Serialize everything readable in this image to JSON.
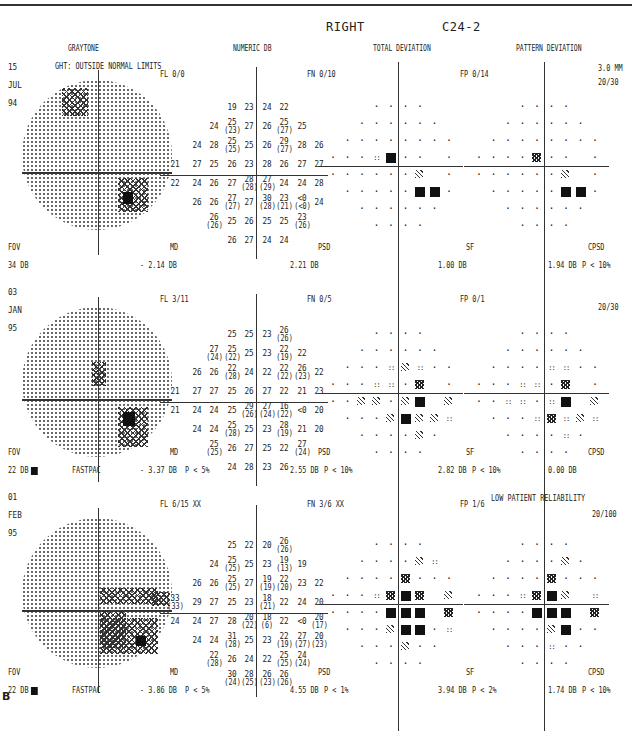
{
  "header": {
    "eye": "RIGHT",
    "test": "C24-2",
    "columns": [
      "GRAYTONE",
      "NUMERIC DB",
      "TOTAL DEVIATION",
      "PATTERN DEVIATION"
    ]
  },
  "figure_label": "B",
  "panels": [
    {
      "date": [
        "15",
        "JUL",
        "94"
      ],
      "ght": "GHT: OUTSIDE NORMAL LIMITS",
      "fl": "FL  0/0",
      "fn": "FN  0/10",
      "fp": "FP  0/14",
      "pupil": "3.0 MM",
      "acuity": "20/30",
      "reliability_note": "",
      "fov_label": "FOV",
      "fov_value": "34 DB",
      "fov_marker": false,
      "strategy": "",
      "md_label": "MD",
      "md_value": "- 2.14 DB",
      "md_p": "",
      "psd_label": "PSD",
      "psd_value": "2.21 DB",
      "psd_p": "",
      "sf_label": "SF",
      "sf_value": "1.00 DB",
      "sf_p": "",
      "cpsd_label": "CPSD",
      "cpsd_value": "1.94 DB",
      "cpsd_p": "P <  10%",
      "numeric_rows": [
        [
          "",
          "",
          "",
          "19",
          "23",
          "24",
          "22",
          "",
          ""
        ],
        [
          "",
          "",
          "24",
          "25 (23)",
          "27",
          "26",
          "25 (27)",
          "25",
          ""
        ],
        [
          "",
          "24",
          "28",
          "25 (25)",
          "25",
          "26",
          "29 (27)",
          "28",
          "26"
        ],
        [
          "21",
          "27",
          "25",
          "26",
          "23",
          "28",
          "26",
          "27",
          "27"
        ],
        [
          "22",
          "24",
          "26",
          "27",
          "28 (28)",
          "27 (29)",
          "24",
          "24",
          "28"
        ],
        [
          "",
          "26",
          "26",
          "27 (27)",
          "27",
          "30 (28)",
          "23 (21)",
          "<0 (<0)",
          "24"
        ],
        [
          "",
          "",
          "26 (26)",
          "25",
          "26",
          "25",
          "25",
          "23 (26)",
          ""
        ],
        [
          "",
          "",
          "",
          "26",
          "27",
          "24",
          "24",
          "",
          ""
        ]
      ],
      "total_dev_rows": [
        [
          "",
          "",
          "",
          ".",
          ".",
          ".",
          ".",
          "",
          ""
        ],
        [
          "",
          "",
          ".",
          ".",
          ".",
          ".",
          ".",
          ".",
          ""
        ],
        [
          "",
          ".",
          ".",
          ".",
          ".",
          ".",
          ".",
          ".",
          "."
        ],
        [
          ".",
          ".",
          ".",
          "2",
          "05",
          ".",
          ".",
          "",
          "."
        ],
        [
          ".",
          ".",
          ".",
          ".",
          ".",
          ".",
          "5",
          "",
          "."
        ],
        [
          "",
          ".",
          ".",
          ".",
          ".",
          ".",
          "05",
          "05",
          "."
        ],
        [
          "",
          "",
          ".",
          ".",
          ".",
          ".",
          ".",
          ".",
          ""
        ],
        [
          "",
          "",
          "",
          ".",
          ".",
          ".",
          ".",
          "",
          ""
        ]
      ],
      "pattern_dev_rows": [
        [
          "",
          "",
          "",
          ".",
          ".",
          ".",
          ".",
          "",
          ""
        ],
        [
          "",
          "",
          ".",
          ".",
          ".",
          ".",
          ".",
          ".",
          ""
        ],
        [
          "",
          ".",
          ".",
          ".",
          ".",
          ".",
          ".",
          ".",
          "."
        ],
        [
          ".",
          ".",
          ".",
          ".",
          "1",
          ".",
          ".",
          "",
          "."
        ],
        [
          ".",
          ".",
          ".",
          ".",
          ".",
          ".",
          "5",
          "",
          "."
        ],
        [
          "",
          ".",
          ".",
          ".",
          ".",
          ".",
          "05",
          "05",
          "."
        ],
        [
          "",
          "",
          ".",
          ".",
          ".",
          ".",
          ".",
          ".",
          ""
        ],
        [
          "",
          "",
          "",
          ".",
          ".",
          ".",
          ".",
          "",
          ""
        ]
      ]
    },
    {
      "date": [
        "03",
        "JAN",
        "95"
      ],
      "ght": "",
      "fl": "FL  3/11",
      "fn": "FN  0/5",
      "fp": "FP  0/1",
      "pupil": "",
      "acuity": "20/30",
      "reliability_note": "",
      "fov_label": "FOV",
      "fov_value": "22 DB",
      "fov_marker": true,
      "strategy": "FASTPAC",
      "md_label": "MD",
      "md_value": "- 3.37 DB",
      "md_p": "P <  5%",
      "psd_label": "PSD",
      "psd_value": "2.55 DB",
      "psd_p": "P <  10%",
      "sf_label": "SF",
      "sf_value": "2.82 DB",
      "sf_p": "P <  10%",
      "cpsd_label": "CPSD",
      "cpsd_value": "0.00 DB",
      "cpsd_p": "",
      "numeric_rows": [
        [
          "",
          "",
          "",
          "25",
          "25",
          "23",
          "26 (26)",
          "",
          ""
        ],
        [
          "",
          "",
          "27 (24)",
          "25 (22)",
          "25",
          "23",
          "22 (19)",
          "22",
          ""
        ],
        [
          "",
          "26",
          "26",
          "22 (28)",
          "24",
          "22",
          "22 (22)",
          "26 (23)",
          "22"
        ],
        [
          "21",
          "27",
          "27",
          "25",
          "26",
          "27",
          "22",
          "21",
          "23"
        ],
        [
          "21",
          "24",
          "24",
          "25",
          "29 (26)",
          "27 (24)",
          "16 (22)",
          "<0",
          "20"
        ],
        [
          "",
          "24",
          "24",
          "25 (28)",
          "25",
          "23",
          "28 (19)",
          "21",
          "20"
        ],
        [
          "",
          "",
          "25 (25)",
          "26",
          "27",
          "25",
          "22",
          "27 (24)",
          ""
        ],
        [
          "",
          "",
          "",
          "24",
          "28",
          "23",
          "26",
          "",
          ""
        ]
      ],
      "total_dev_rows": [
        [
          "",
          "",
          "",
          ".",
          ".",
          ".",
          ".",
          "",
          ""
        ],
        [
          "",
          "",
          ".",
          ".",
          ".",
          ".",
          ".",
          ".",
          ""
        ],
        [
          "",
          ".",
          ".",
          ".",
          "2",
          "5",
          "2",
          ".",
          "."
        ],
        [
          ".",
          ".",
          ".",
          "2",
          "2",
          ".",
          "1",
          "",
          "."
        ],
        [
          ".",
          ".",
          "5",
          "5",
          ".",
          "5",
          "05",
          "",
          "5"
        ],
        [
          "",
          ".",
          ".",
          ".",
          "5",
          "05",
          "5",
          "5",
          "2"
        ],
        [
          "",
          "",
          ".",
          ".",
          ".",
          ".",
          "5",
          ".",
          ""
        ],
        [
          "",
          "",
          "",
          ".",
          ".",
          ".",
          ".",
          "",
          ""
        ]
      ],
      "pattern_dev_rows": [
        [
          "",
          "",
          "",
          ".",
          ".",
          ".",
          ".",
          "",
          ""
        ],
        [
          "",
          "",
          ".",
          ".",
          ".",
          ".",
          ".",
          ".",
          ""
        ],
        [
          "",
          ".",
          ".",
          ".",
          ".",
          "2",
          "2",
          ".",
          "."
        ],
        [
          ".",
          ".",
          ".",
          "2",
          "2",
          ".",
          "1",
          "",
          "."
        ],
        [
          ".",
          ".",
          "2",
          "2",
          ".",
          "2",
          "05",
          "",
          "5"
        ],
        [
          "",
          ".",
          ".",
          ".",
          "2",
          "1",
          "2",
          "5",
          "2"
        ],
        [
          "",
          "",
          ".",
          ".",
          ".",
          ".",
          "2",
          ".",
          ""
        ],
        [
          "",
          "",
          "",
          ".",
          ".",
          ".",
          ".",
          "",
          ""
        ]
      ]
    },
    {
      "date": [
        "01",
        "FEB",
        "95"
      ],
      "ght": "",
      "fl": "FL  6/15 XX",
      "fn": "FN  3/6 XX",
      "fp": "FP  1/6",
      "pupil": "",
      "acuity": "20/100",
      "reliability_note": "LOW PATIENT RELIABILITY",
      "fov_label": "FOV",
      "fov_value": "22 DB",
      "fov_marker": true,
      "strategy": "FASTPAC",
      "md_label": "MD",
      "md_value": "- 3.86 DB",
      "md_p": "P <  5%",
      "psd_label": "PSD",
      "psd_value": "4.55 DB",
      "psd_p": "P <  1%",
      "sf_label": "SF",
      "sf_value": "3.94 DB",
      "sf_p": "P <  2%",
      "cpsd_label": "CPSD",
      "cpsd_value": "1.74 DB",
      "cpsd_p": "P <  10%",
      "numeric_rows": [
        [
          "",
          "",
          "",
          "25",
          "22",
          "20",
          "26 (26)",
          "",
          ""
        ],
        [
          "",
          "",
          "24",
          "25 (25)",
          "25",
          "23",
          "19 (13)",
          "19",
          ""
        ],
        [
          "",
          "26",
          "26",
          "25 (25)",
          "27",
          "19 (19)",
          "22 (20)",
          "23",
          "22"
        ],
        [
          "33 (33)",
          "29",
          "27",
          "25",
          "23",
          "18 (21)",
          "22",
          "24",
          "20"
        ],
        [
          "24",
          "24",
          "27",
          "28",
          "20 (22)",
          "18 (6)",
          "22",
          "<0",
          "20 (17)"
        ],
        [
          "",
          "24",
          "24",
          "31 (28)",
          "25",
          "23",
          "22 (19)",
          "27 (27)",
          "20 (23)"
        ],
        [
          "",
          "",
          "22 (28)",
          "26",
          "24",
          "22",
          "25 (25)",
          "24 (24)",
          ""
        ],
        [
          "",
          "",
          "",
          "30 (24)",
          "28 (25)",
          "26 (23)",
          "26 (26)",
          "",
          ""
        ]
      ],
      "total_dev_rows": [
        [
          "",
          "",
          "",
          ".",
          ".",
          ".",
          ".",
          "",
          ""
        ],
        [
          "",
          "",
          ".",
          ".",
          ".",
          ".",
          "5",
          "2",
          ""
        ],
        [
          "",
          ".",
          ".",
          ".",
          ".",
          "1",
          ".",
          ".",
          "."
        ],
        [
          ".",
          ".",
          ".",
          "2",
          "1",
          "05",
          "1",
          "",
          "5"
        ],
        [
          ".",
          ".",
          ".",
          ".",
          "05",
          "05",
          "05",
          "",
          "1"
        ],
        [
          "",
          ".",
          ".",
          ".",
          "5",
          "05",
          "05",
          ".",
          "2"
        ],
        [
          "",
          "",
          ".",
          ".",
          ".",
          "5",
          ".",
          ".",
          ""
        ],
        [
          "",
          "",
          "",
          ".",
          ".",
          ".",
          ".",
          "",
          ""
        ]
      ],
      "pattern_dev_rows": [
        [
          "",
          "",
          "",
          ".",
          ".",
          ".",
          ".",
          "",
          ""
        ],
        [
          "",
          "",
          ".",
          ".",
          ".",
          ".",
          "5",
          ".",
          ""
        ],
        [
          "",
          ".",
          ".",
          ".",
          ".",
          "1",
          ".",
          ".",
          "."
        ],
        [
          ".",
          ".",
          ".",
          "2",
          "1",
          "05",
          "5",
          "",
          "2"
        ],
        [
          ".",
          ".",
          ".",
          ".",
          "05",
          "05",
          "05",
          "",
          "1"
        ],
        [
          "",
          ".",
          ".",
          ".",
          ".",
          "5",
          "05",
          ".",
          "."
        ],
        [
          "",
          "",
          ".",
          ".",
          ".",
          "2",
          ".",
          ".",
          ""
        ],
        [
          "",
          "",
          "",
          ".",
          ".",
          ".",
          ".",
          "",
          ""
        ]
      ]
    }
  ],
  "legend_symbols": {
    ".": "normal (dot)",
    "2": "P < 5% (sparse dots)",
    "5": "P < 2% (light hatch)",
    "1": "P < 1% (dense crosshatch)",
    "05": "P < 0.5% (solid black square)"
  }
}
